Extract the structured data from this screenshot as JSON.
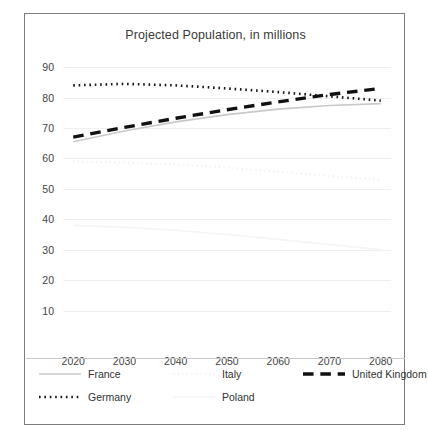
{
  "chart_data": {
    "type": "line",
    "title": "Projected Population, in millions",
    "xlabel": "",
    "ylabel": "",
    "x": [
      2020,
      2030,
      2040,
      2050,
      2060,
      2070,
      2080
    ],
    "xlim": [
      2018,
      2082
    ],
    "ylim": [
      0,
      93
    ],
    "yticks": [
      10,
      20,
      30,
      40,
      50,
      60,
      70,
      80,
      90
    ],
    "xticks": [
      "2020",
      "2030",
      "2040",
      "2050",
      "2060",
      "2070",
      "2080"
    ],
    "grid": true,
    "legend_position": "bottom",
    "series": [
      {
        "name": "France",
        "style": "solid",
        "color": "#c9c9c9",
        "width": 1.6,
        "values": [
          65.5,
          69.0,
          72.0,
          74.4,
          76.2,
          77.4,
          78.0
        ]
      },
      {
        "name": "Germany",
        "style": "dotted",
        "color": "#1a1a1a",
        "width": 2.6,
        "values": [
          84.0,
          84.5,
          84.0,
          83.0,
          81.8,
          80.4,
          79.0
        ]
      },
      {
        "name": "Italy",
        "style": "dotted",
        "color": "#f2f2f2",
        "width": 2.2,
        "values": [
          59.0,
          58.6,
          58.0,
          57.0,
          55.6,
          54.2,
          53.0
        ]
      },
      {
        "name": "Poland",
        "style": "solid",
        "color": "#f4f4f4",
        "width": 1.6,
        "values": [
          38.0,
          37.4,
          36.4,
          35.0,
          33.4,
          31.7,
          30.0
        ]
      },
      {
        "name": "United Kingdom",
        "style": "dashed",
        "color": "#111111",
        "width": 3.4,
        "values": [
          67.0,
          70.2,
          73.2,
          76.0,
          78.6,
          81.0,
          83.0
        ]
      }
    ]
  },
  "legend": {
    "items": [
      {
        "label": "France"
      },
      {
        "label": "Germany"
      },
      {
        "label": "Italy"
      },
      {
        "label": "Poland"
      },
      {
        "label": "United Kingdom"
      }
    ]
  }
}
